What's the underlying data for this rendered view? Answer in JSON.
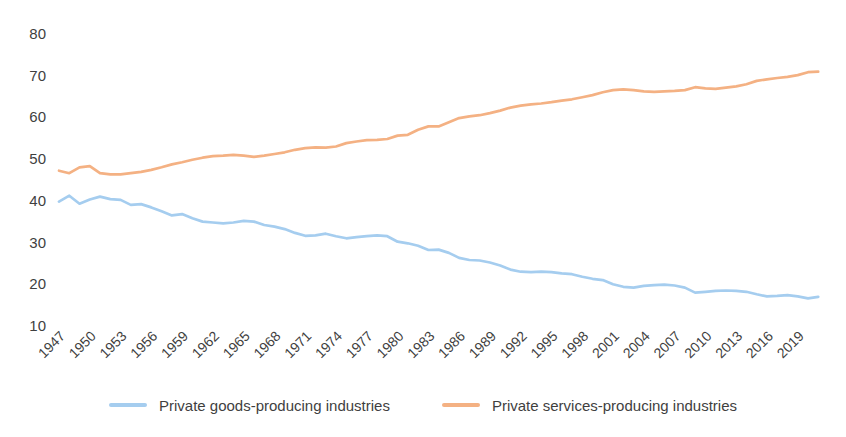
{
  "chart_data": {
    "type": "line",
    "title": "",
    "xlabel": "",
    "ylabel": "",
    "ylim": [
      10,
      80
    ],
    "grid": false,
    "legend_position": "bottom",
    "y_ticks": [
      10,
      20,
      30,
      40,
      50,
      60,
      70,
      80
    ],
    "x_tick_labels": [
      "1947",
      "1950",
      "1953",
      "1956",
      "1959",
      "1962",
      "1965",
      "1968",
      "1971",
      "1974",
      "1977",
      "1980",
      "1983",
      "1986",
      "1989",
      "1992",
      "1995",
      "1998",
      "2001",
      "2004",
      "2007",
      "2010",
      "2013",
      "2016",
      "2019"
    ],
    "x": [
      1947,
      1948,
      1949,
      1950,
      1951,
      1952,
      1953,
      1954,
      1955,
      1956,
      1957,
      1958,
      1959,
      1960,
      1961,
      1962,
      1963,
      1964,
      1965,
      1966,
      1967,
      1968,
      1969,
      1970,
      1971,
      1972,
      1973,
      1974,
      1975,
      1976,
      1977,
      1978,
      1979,
      1980,
      1981,
      1982,
      1983,
      1984,
      1985,
      1986,
      1987,
      1988,
      1989,
      1990,
      1991,
      1992,
      1993,
      1994,
      1995,
      1996,
      1997,
      1998,
      1999,
      2000,
      2001,
      2002,
      2003,
      2004,
      2005,
      2006,
      2007,
      2008,
      2009,
      2010,
      2011,
      2012,
      2013,
      2014,
      2015,
      2016,
      2017,
      2018,
      2019,
      2020,
      2021
    ],
    "series": [
      {
        "name": "Private goods-producing industries",
        "color": "#A5CDEF",
        "values": [
          39.8,
          41.2,
          39.3,
          40.3,
          41.0,
          40.4,
          40.2,
          39.0,
          39.2,
          38.4,
          37.5,
          36.5,
          36.8,
          35.8,
          35.0,
          34.8,
          34.6,
          34.8,
          35.2,
          35.0,
          34.2,
          33.8,
          33.2,
          32.3,
          31.6,
          31.7,
          32.1,
          31.5,
          31.0,
          31.3,
          31.5,
          31.7,
          31.5,
          30.2,
          29.8,
          29.2,
          28.2,
          28.3,
          27.5,
          26.3,
          25.8,
          25.7,
          25.2,
          24.5,
          23.5,
          23.0,
          22.9,
          23.0,
          22.9,
          22.6,
          22.4,
          21.8,
          21.3,
          21.0,
          20.0,
          19.4,
          19.2,
          19.6,
          19.8,
          19.9,
          19.7,
          19.2,
          18.0,
          18.2,
          18.4,
          18.5,
          18.4,
          18.2,
          17.6,
          17.1,
          17.2,
          17.4,
          17.1,
          16.6,
          17.0
        ]
      },
      {
        "name": "Private services-producing industries",
        "color": "#F4B183",
        "values": [
          47.2,
          46.6,
          48.0,
          48.3,
          46.6,
          46.3,
          46.3,
          46.6,
          46.9,
          47.4,
          48.0,
          48.7,
          49.2,
          49.8,
          50.3,
          50.7,
          50.8,
          51.0,
          50.8,
          50.5,
          50.8,
          51.2,
          51.6,
          52.2,
          52.6,
          52.8,
          52.7,
          53.0,
          53.8,
          54.2,
          54.5,
          54.6,
          54.8,
          55.6,
          55.8,
          57.0,
          57.8,
          57.8,
          58.8,
          59.8,
          60.2,
          60.5,
          61.0,
          61.6,
          62.3,
          62.8,
          63.1,
          63.3,
          63.6,
          64.0,
          64.3,
          64.8,
          65.3,
          66.0,
          66.5,
          66.7,
          66.5,
          66.2,
          66.1,
          66.2,
          66.3,
          66.5,
          67.2,
          66.9,
          66.8,
          67.1,
          67.4,
          67.9,
          68.7,
          69.1,
          69.4,
          69.7,
          70.1,
          70.8,
          70.9
        ]
      }
    ]
  },
  "legend": {
    "goods_label": "Private goods-producing industries",
    "services_label": "Private services-producing industries"
  },
  "colors": {
    "goods_line": "#A5CDEF",
    "services_line": "#F4B183",
    "axis_text": "#3f3f3f",
    "background": "#ffffff"
  }
}
